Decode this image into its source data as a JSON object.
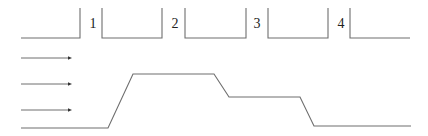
{
  "diagram": {
    "type": "stage-profile",
    "colors": {
      "line": "#6e6e6e",
      "text": "#222222",
      "background": "#ffffff"
    },
    "top_row": {
      "description": "Open-top boxes separated by numbered labels",
      "baseline_y": 38,
      "top_y": 8,
      "segments": [
        {
          "x1": 21,
          "x2": 80,
          "left_wall": false,
          "right_wall": true
        },
        {
          "x1": 102,
          "x2": 162,
          "left_wall": true,
          "right_wall": true
        },
        {
          "x1": 185,
          "x2": 246,
          "left_wall": true,
          "right_wall": true
        },
        {
          "x1": 268,
          "x2": 328,
          "left_wall": true,
          "right_wall": true
        },
        {
          "x1": 350,
          "x2": 410,
          "left_wall": true,
          "right_wall": false
        }
      ],
      "labels": [
        {
          "text": "1",
          "x": 93
        },
        {
          "text": "2",
          "x": 175
        },
        {
          "text": "3",
          "x": 257
        },
        {
          "text": "4",
          "x": 341
        }
      ]
    },
    "arrows": [
      {
        "x1": 21,
        "x2": 72,
        "y": 58
      },
      {
        "x1": 21,
        "x2": 72,
        "y": 84
      },
      {
        "x1": 21,
        "x2": 72,
        "y": 110
      }
    ],
    "profile": {
      "points": [
        [
          21,
          128
        ],
        [
          108,
          128
        ],
        [
          133,
          74
        ],
        [
          214,
          74
        ],
        [
          229,
          97
        ],
        [
          300,
          97
        ],
        [
          314,
          126
        ],
        [
          411,
          126
        ]
      ]
    }
  }
}
